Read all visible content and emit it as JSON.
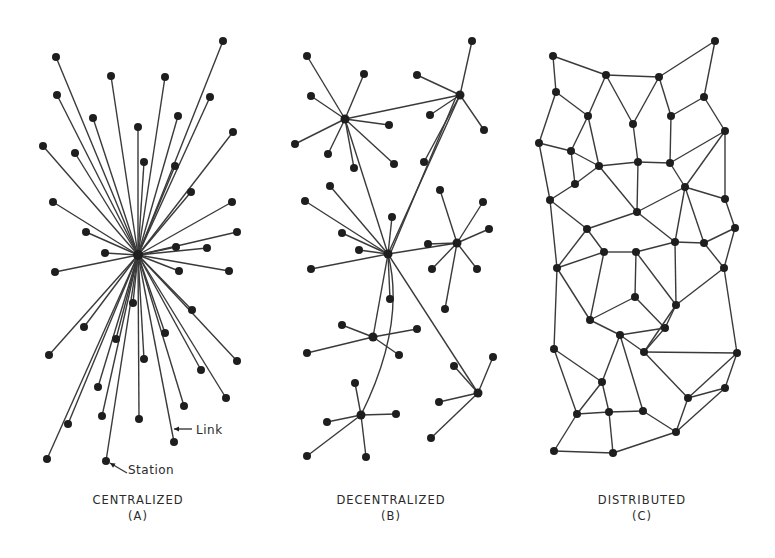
{
  "figure": {
    "background": "#ffffff",
    "ink_color": "#1e1e1e",
    "panels": [
      {
        "id": "A",
        "title": "CENTRALIZED",
        "letter": "(A)",
        "caption_pos": [
          138,
          508
        ],
        "type": "star",
        "hub": [
          138,
          255
        ],
        "nodes": [
          [
            223,
            41
          ],
          [
            56,
            57
          ],
          [
            111,
            76
          ],
          [
            165,
            77
          ],
          [
            210,
            97
          ],
          [
            57,
            95
          ],
          [
            93,
            118
          ],
          [
            178,
            116
          ],
          [
            138,
            127
          ],
          [
            43,
            146
          ],
          [
            75,
            153
          ],
          [
            233,
            132
          ],
          [
            144,
            162
          ],
          [
            175,
            166
          ],
          [
            191,
            192
          ],
          [
            53,
            202
          ],
          [
            232,
            202
          ],
          [
            86,
            232
          ],
          [
            237,
            232
          ],
          [
            176,
            247
          ],
          [
            105,
            253
          ],
          [
            207,
            248
          ],
          [
            55,
            272
          ],
          [
            179,
            271
          ],
          [
            229,
            271
          ],
          [
            133,
            303
          ],
          [
            192,
            310
          ],
          [
            84,
            327
          ],
          [
            116,
            339
          ],
          [
            49,
            355
          ],
          [
            165,
            333
          ],
          [
            144,
            359
          ],
          [
            237,
            361
          ],
          [
            98,
            387
          ],
          [
            201,
            370
          ],
          [
            226,
            398
          ],
          [
            184,
            406
          ],
          [
            102,
            416
          ],
          [
            139,
            419
          ],
          [
            68,
            424
          ],
          [
            174,
            442
          ],
          [
            106,
            461
          ],
          [
            47,
            459
          ]
        ],
        "annotations": [
          {
            "label": "Link",
            "text_pos": [
              196,
              435
            ],
            "arrow_from": [
              192,
              429
            ],
            "arrow_to": [
              174,
              429
            ]
          },
          {
            "label": "Station",
            "text_pos": [
              128,
              475
            ],
            "arrow_from": [
              127,
              473
            ],
            "arrow_to": [
              110,
              463
            ]
          }
        ]
      },
      {
        "id": "B",
        "title": "DECENTRALIZED",
        "letter": "(B)",
        "caption_pos": [
          391,
          508
        ],
        "type": "multi-star",
        "hubs": [
          [
            345,
            119
          ],
          [
            460,
            95
          ],
          [
            388,
            254
          ],
          [
            457,
            243
          ],
          [
            373,
            337
          ],
          [
            478,
            393
          ],
          [
            361,
            415
          ]
        ],
        "leaves": [
          {
            "hub": 0,
            "nodes": [
              [
                307,
                56
              ],
              [
                364,
                74
              ],
              [
                311,
                96
              ],
              [
                295,
                144
              ],
              [
                328,
                154
              ],
              [
                389,
                125
              ],
              [
                354,
                168
              ],
              [
                394,
                164
              ]
            ]
          },
          {
            "hub": 1,
            "nodes": [
              [
                472,
                41
              ],
              [
                417,
                75
              ],
              [
                430,
                115
              ],
              [
                484,
                130
              ],
              [
                424,
                162
              ]
            ]
          },
          {
            "hub": 2,
            "nodes": [
              [
                330,
                186
              ],
              [
                305,
                201
              ],
              [
                342,
                233
              ],
              [
                392,
                217
              ],
              [
                359,
                250
              ],
              [
                311,
                269
              ],
              [
                390,
                299
              ]
            ]
          },
          {
            "hub": 3,
            "nodes": [
              [
                440,
                190
              ],
              [
                483,
                202
              ],
              [
                489,
                229
              ],
              [
                428,
                244
              ],
              [
                432,
                269
              ],
              [
                477,
                269
              ],
              [
                445,
                309
              ]
            ]
          },
          {
            "hub": 4,
            "nodes": [
              [
                342,
                325
              ],
              [
                417,
                329
              ],
              [
                307,
                353
              ],
              [
                399,
                355
              ]
            ]
          },
          {
            "hub": 5,
            "nodes": [
              [
                493,
                357
              ],
              [
                454,
                366
              ],
              [
                439,
                402
              ],
              [
                431,
                438
              ]
            ]
          },
          {
            "hub": 6,
            "nodes": [
              [
                355,
                383
              ],
              [
                327,
                422
              ],
              [
                396,
                414
              ],
              [
                307,
                456
              ],
              [
                366,
                457
              ]
            ]
          }
        ],
        "hub_links": [
          [
            0,
            1
          ],
          [
            0,
            2
          ],
          [
            1,
            2
          ],
          [
            1,
            2
          ],
          [
            2,
            3
          ],
          [
            2,
            4
          ],
          [
            2,
            5
          ],
          [
            2,
            6
          ]
        ]
      },
      {
        "id": "C",
        "title": "DISTRIBUTED",
        "letter": "(C)",
        "caption_pos": [
          642,
          508
        ],
        "type": "mesh",
        "nodes": [
          [
            553,
            56
          ],
          [
            715,
            41
          ],
          [
            606,
            75
          ],
          [
            659,
            77
          ],
          [
            556,
            92
          ],
          [
            704,
            97
          ],
          [
            588,
            116
          ],
          [
            633,
            124
          ],
          [
            671,
            116
          ],
          [
            725,
            131
          ],
          [
            539,
            143
          ],
          [
            571,
            151
          ],
          [
            599,
            166
          ],
          [
            638,
            162
          ],
          [
            670,
            163
          ],
          [
            685,
            187
          ],
          [
            725,
            199
          ],
          [
            575,
            184
          ],
          [
            550,
            200
          ],
          [
            637,
            212
          ],
          [
            587,
            229
          ],
          [
            735,
            228
          ],
          [
            604,
            252
          ],
          [
            636,
            252
          ],
          [
            675,
            242
          ],
          [
            704,
            243
          ],
          [
            557,
            268
          ],
          [
            724,
            268
          ],
          [
            676,
            305
          ],
          [
            635,
            297
          ],
          [
            590,
            320
          ],
          [
            665,
            328
          ],
          [
            620,
            335
          ],
          [
            644,
            352
          ],
          [
            554,
            349
          ],
          [
            737,
            353
          ],
          [
            602,
            382
          ],
          [
            688,
            398
          ],
          [
            725,
            388
          ],
          [
            577,
            414
          ],
          [
            609,
            412
          ],
          [
            643,
            411
          ],
          [
            676,
            432
          ],
          [
            554,
            451
          ],
          [
            613,
            453
          ]
        ],
        "edges": [
          [
            0,
            2
          ],
          [
            2,
            3
          ],
          [
            3,
            1
          ],
          [
            1,
            5
          ],
          [
            0,
            4
          ],
          [
            4,
            6
          ],
          [
            2,
            6
          ],
          [
            2,
            7
          ],
          [
            3,
            7
          ],
          [
            3,
            8
          ],
          [
            5,
            8
          ],
          [
            5,
            9
          ],
          [
            4,
            10
          ],
          [
            6,
            11
          ],
          [
            6,
            12
          ],
          [
            7,
            13
          ],
          [
            8,
            14
          ],
          [
            10,
            11
          ],
          [
            11,
            12
          ],
          [
            12,
            13
          ],
          [
            13,
            14
          ],
          [
            9,
            14
          ],
          [
            9,
            15
          ],
          [
            14,
            15
          ],
          [
            11,
            17
          ],
          [
            12,
            17
          ],
          [
            10,
            18
          ],
          [
            17,
            18
          ],
          [
            12,
            19
          ],
          [
            13,
            19
          ],
          [
            15,
            19
          ],
          [
            9,
            16
          ],
          [
            15,
            16
          ],
          [
            15,
            24
          ],
          [
            15,
            25
          ],
          [
            16,
            21
          ],
          [
            19,
            20
          ],
          [
            18,
            20
          ],
          [
            20,
            22
          ],
          [
            20,
            26
          ],
          [
            22,
            23
          ],
          [
            19,
            24
          ],
          [
            23,
            24
          ],
          [
            24,
            25
          ],
          [
            25,
            21
          ],
          [
            25,
            27
          ],
          [
            21,
            27
          ],
          [
            22,
            26
          ],
          [
            18,
            26
          ],
          [
            23,
            28
          ],
          [
            24,
            28
          ],
          [
            27,
            28
          ],
          [
            28,
            31
          ],
          [
            23,
            29
          ],
          [
            29,
            30
          ],
          [
            22,
            30
          ],
          [
            26,
            30
          ],
          [
            26,
            34
          ],
          [
            29,
            31
          ],
          [
            31,
            32
          ],
          [
            30,
            32
          ],
          [
            32,
            33
          ],
          [
            31,
            33
          ],
          [
            28,
            33
          ],
          [
            33,
            35
          ],
          [
            27,
            35
          ],
          [
            34,
            36
          ],
          [
            32,
            36
          ],
          [
            33,
            37
          ],
          [
            35,
            37
          ],
          [
            35,
            38
          ],
          [
            36,
            39
          ],
          [
            36,
            40
          ],
          [
            40,
            39
          ],
          [
            40,
            41
          ],
          [
            41,
            42
          ],
          [
            37,
            42
          ],
          [
            38,
            42
          ],
          [
            37,
            38
          ],
          [
            34,
            39
          ],
          [
            39,
            43
          ],
          [
            43,
            44
          ],
          [
            40,
            44
          ],
          [
            44,
            42
          ],
          [
            32,
            41
          ]
        ]
      }
    ]
  }
}
